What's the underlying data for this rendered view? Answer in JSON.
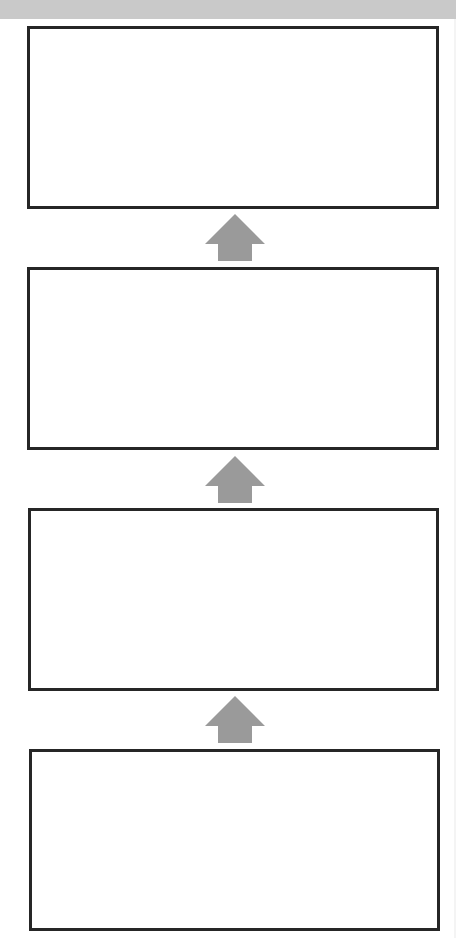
{
  "diagram": {
    "type": "vertical-flow",
    "direction": "bottom-to-top",
    "colors": {
      "banner": "#c9c9c9",
      "box_border": "#262626",
      "box_fill": "#ffffff",
      "arrow": "#9a9a9a"
    },
    "boxes": [
      {
        "id": "box-1",
        "label": ""
      },
      {
        "id": "box-2",
        "label": ""
      },
      {
        "id": "box-3",
        "label": ""
      },
      {
        "id": "box-4",
        "label": ""
      }
    ],
    "arrows": [
      {
        "from": "box-2",
        "to": "box-1",
        "icon": "up-arrow-icon"
      },
      {
        "from": "box-3",
        "to": "box-2",
        "icon": "up-arrow-icon"
      },
      {
        "from": "box-4",
        "to": "box-3",
        "icon": "up-arrow-icon"
      }
    ]
  }
}
